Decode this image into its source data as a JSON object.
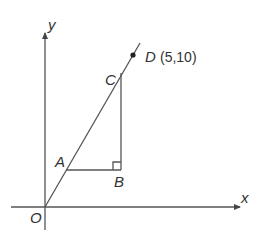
{
  "diagram": {
    "axes": {
      "x_label": "x",
      "y_label": "y",
      "origin_label": "O"
    },
    "points": {
      "A": {
        "label": "A"
      },
      "B": {
        "label": "B"
      },
      "C": {
        "label": "C"
      },
      "D": {
        "label": "D",
        "coords_text": "(5,10)",
        "x": 5,
        "y": 10
      }
    },
    "right_angle_at": "B",
    "colors": {
      "stroke": "#555555",
      "text": "#333333"
    }
  }
}
